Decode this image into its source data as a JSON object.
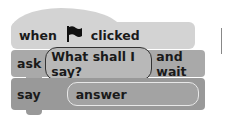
{
  "blocks": {
    "hat": {
      "word1": "when",
      "icon": "green-flag-icon",
      "word2": "clicked"
    },
    "ask": {
      "label": "ask",
      "input": "What shall I say?",
      "suffix": "and wait"
    },
    "say": {
      "label": "say",
      "input": "answer"
    }
  }
}
